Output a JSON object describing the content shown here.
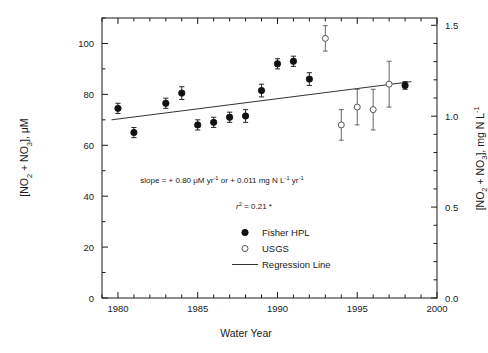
{
  "figure": {
    "faint_header": "",
    "x_axis": {
      "label": "Water Year",
      "min": 1979,
      "max": 2000,
      "major_ticks": [
        1980,
        1985,
        1990,
        1995,
        2000
      ],
      "major_tick_labels": [
        "1980",
        "1985",
        "1990",
        "1995",
        "2000"
      ],
      "minor_tick_step": 1
    },
    "y_axis_left": {
      "label_html": "[NO<sub>2</sub> + NO<sub>3</sub>], μM",
      "label_plain": "[NO2 + NO3], μM",
      "min": 0,
      "max": 110,
      "major_ticks": [
        0,
        20,
        40,
        60,
        80,
        100
      ],
      "major_tick_labels": [
        "0",
        "20",
        "40",
        "60",
        "80",
        "100"
      ],
      "minor_tick_step": 10
    },
    "y_axis_right": {
      "label_html": "[NO<sub>2</sub> + NO<sub>3</sub>], mg N L<sup>-1</sup>",
      "label_plain": "[NO2 + NO3], mg N L-1",
      "min": 0.0,
      "max": 1.54,
      "major_ticks": [
        0.0,
        0.5,
        1.0,
        1.5
      ],
      "major_tick_labels": [
        "0.0",
        "0.5",
        "1.0",
        "1.5"
      ],
      "minor_tick_step": 0.1
    },
    "annotations": {
      "slope_html": "slope = + 0.80 μM yr<sup>-1</sup> or + 0.011 mg N L<sup>-1</sup> yr<sup>-1</sup>",
      "slope_plain": "slope = + 0.80 μM yr-1 or + 0.011 mg N L-1 yr-1",
      "r2_html": "r<sup>2</sup> = 0.21 *",
      "r2_plain": "r2 = 0.21 *"
    },
    "legend": {
      "items": [
        {
          "label": "Fisher HPL",
          "marker": "filled-circle"
        },
        {
          "label": "USGS",
          "marker": "open-circle"
        },
        {
          "label": "Regression Line",
          "marker": "line"
        }
      ]
    },
    "colors": {
      "axis": "#1a1a1a",
      "filled_marker": "#111111",
      "open_marker_stroke": "#555555",
      "regression_line": "#333333",
      "background": "#ffffff"
    }
  },
  "chart_data": {
    "type": "scatter",
    "title": "",
    "xlabel": "Water Year",
    "ylabel": "[NO2 + NO3], μM",
    "ylabel_secondary": "[NO2 + NO3], mg N L-1",
    "xlim": [
      1979,
      2000
    ],
    "ylim": [
      0,
      110
    ],
    "ylim_secondary": [
      0.0,
      1.54
    ],
    "grid": false,
    "legend_position": "center-right-inside",
    "conversion_note": "right axis mg N L-1 = left axis μM x 0.014",
    "series": [
      {
        "name": "Fisher HPL",
        "marker": "filled-circle",
        "x": [
          1980,
          1981,
          1983,
          1984,
          1985,
          1986,
          1987,
          1988,
          1989,
          1990,
          1991,
          1992,
          1998
        ],
        "values": [
          74.5,
          65.0,
          76.5,
          80.5,
          68.0,
          69.0,
          71.0,
          71.5,
          81.5,
          92.0,
          93.0,
          86.0,
          83.5
        ],
        "yerr": [
          2.0,
          2.0,
          2.0,
          2.5,
          2.0,
          2.0,
          2.0,
          2.5,
          2.5,
          2.0,
          2.0,
          2.5,
          1.5
        ]
      },
      {
        "name": "USGS",
        "marker": "open-circle",
        "x": [
          1993,
          1994,
          1995,
          1996,
          1997
        ],
        "values": [
          102.0,
          68.0,
          75.0,
          74.0,
          84.0
        ],
        "yerr": [
          5.0,
          6.0,
          7.0,
          8.0,
          9.0
        ]
      }
    ],
    "regression_line": {
      "name": "Regression Line",
      "slope_uM_per_yr": 0.8,
      "slope_mgN_per_L_per_yr": 0.011,
      "r_squared": 0.21,
      "significance": "*",
      "x_start": 1979.6,
      "x_end": 1998.4,
      "y_start": 70.0,
      "y_end": 85.0
    }
  }
}
